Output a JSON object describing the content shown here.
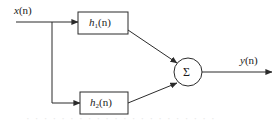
{
  "figure": {
    "type": "block-diagram",
    "background_color": "#ffffff",
    "line_color": "#2b2b2b",
    "text_color": "#1a1a1a"
  },
  "signals": {
    "input": {
      "base": "x",
      "arg": "(n)",
      "full": "x(n)"
    },
    "output": {
      "base": "y",
      "arg": "(n)",
      "full": "y(n)"
    }
  },
  "blocks": [
    {
      "id": "h1",
      "base": "h",
      "subscript": "1",
      "arg": "(n)",
      "full": "h1(n)"
    },
    {
      "id": "h2",
      "base": "h",
      "subscript": "2",
      "arg": "(n)",
      "full": "h2(n)"
    }
  ],
  "adder": {
    "symbol": "Σ",
    "name": "summation-node"
  },
  "artifact": {
    "bleed_text": "· · · · · · · · · · · · · · · · · · · · · ·"
  }
}
